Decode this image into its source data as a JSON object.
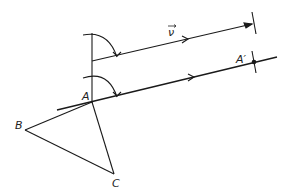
{
  "diagram": {
    "type": "geometry-translation",
    "labels": {
      "A": "A",
      "A_prime": "A′",
      "B": "B",
      "C": "C",
      "vector": "ν"
    },
    "points": {
      "A": [
        92,
        102
      ],
      "A_prime": [
        254,
        62
      ],
      "B": [
        25,
        130
      ],
      "C": [
        114,
        174
      ]
    },
    "colors": {
      "stroke": "#1a1a1a",
      "background": "#ffffff"
    }
  }
}
